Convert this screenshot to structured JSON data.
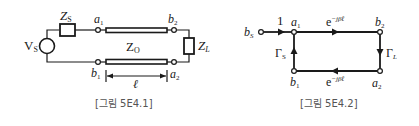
{
  "figures": [
    {
      "id": "fig1",
      "caption": "[그림 5E4.1]",
      "type": "circuit",
      "labels": {
        "source": "V",
        "source_sub": "S",
        "source_impedance": "Z",
        "source_impedance_sub": "S",
        "line_impedance": "Z",
        "line_impedance_sub": "O",
        "load": "Z",
        "load_sub": "L",
        "a1": "a",
        "a1_sub": "1",
        "b1": "b",
        "b1_sub": "1",
        "a2": "a",
        "a2_sub": "2",
        "b2": "b",
        "b2_sub": "2",
        "length": "ℓ"
      }
    },
    {
      "id": "fig2",
      "caption": "[그림 5E4.2]",
      "type": "signal-flow-graph",
      "labels": {
        "bs": "b",
        "bs_sub": "S",
        "unity_gain": "1",
        "a1": "a",
        "a1_sub": "1",
        "b1": "b",
        "b1_sub": "1",
        "a2": "a",
        "a2_sub": "2",
        "b2": "b",
        "b2_sub": "2",
        "gamma_s": "Γ",
        "gamma_s_sub": "S",
        "gamma_l": "Γ",
        "gamma_l_sub": "L",
        "top_branch": "e",
        "top_branch_exp": "−jβℓ",
        "bottom_branch": "e",
        "bottom_branch_exp": "−jβℓ"
      }
    }
  ],
  "colors": {
    "ink": "#1a1a1a",
    "caption": "#555555",
    "background": "#ffffff"
  }
}
